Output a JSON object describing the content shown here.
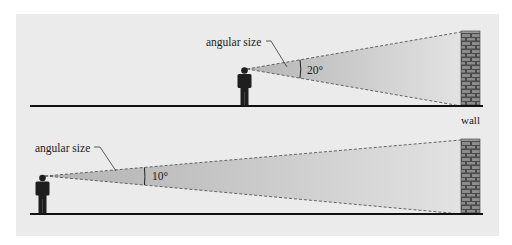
{
  "figure": {
    "background": "#ffffff",
    "panel_color": "#ebebeb",
    "ground_color": "#111111",
    "person_color": "#1e1e1e",
    "cone_near_color": "#b9b9b9",
    "cone_far_color": "#dcdcdc",
    "wall_mortar_color": "#4a4a4a",
    "wall_brick_color": "#8a8a8a"
  },
  "top_scene": {
    "label": "angular size",
    "angle_label": "20°",
    "angle_degrees": 20,
    "description": "observer close to wall"
  },
  "bottom_scene": {
    "label": "angular size",
    "angle_label": "10°",
    "angle_degrees": 10,
    "description": "observer far from wall"
  },
  "wall_label": "wall"
}
